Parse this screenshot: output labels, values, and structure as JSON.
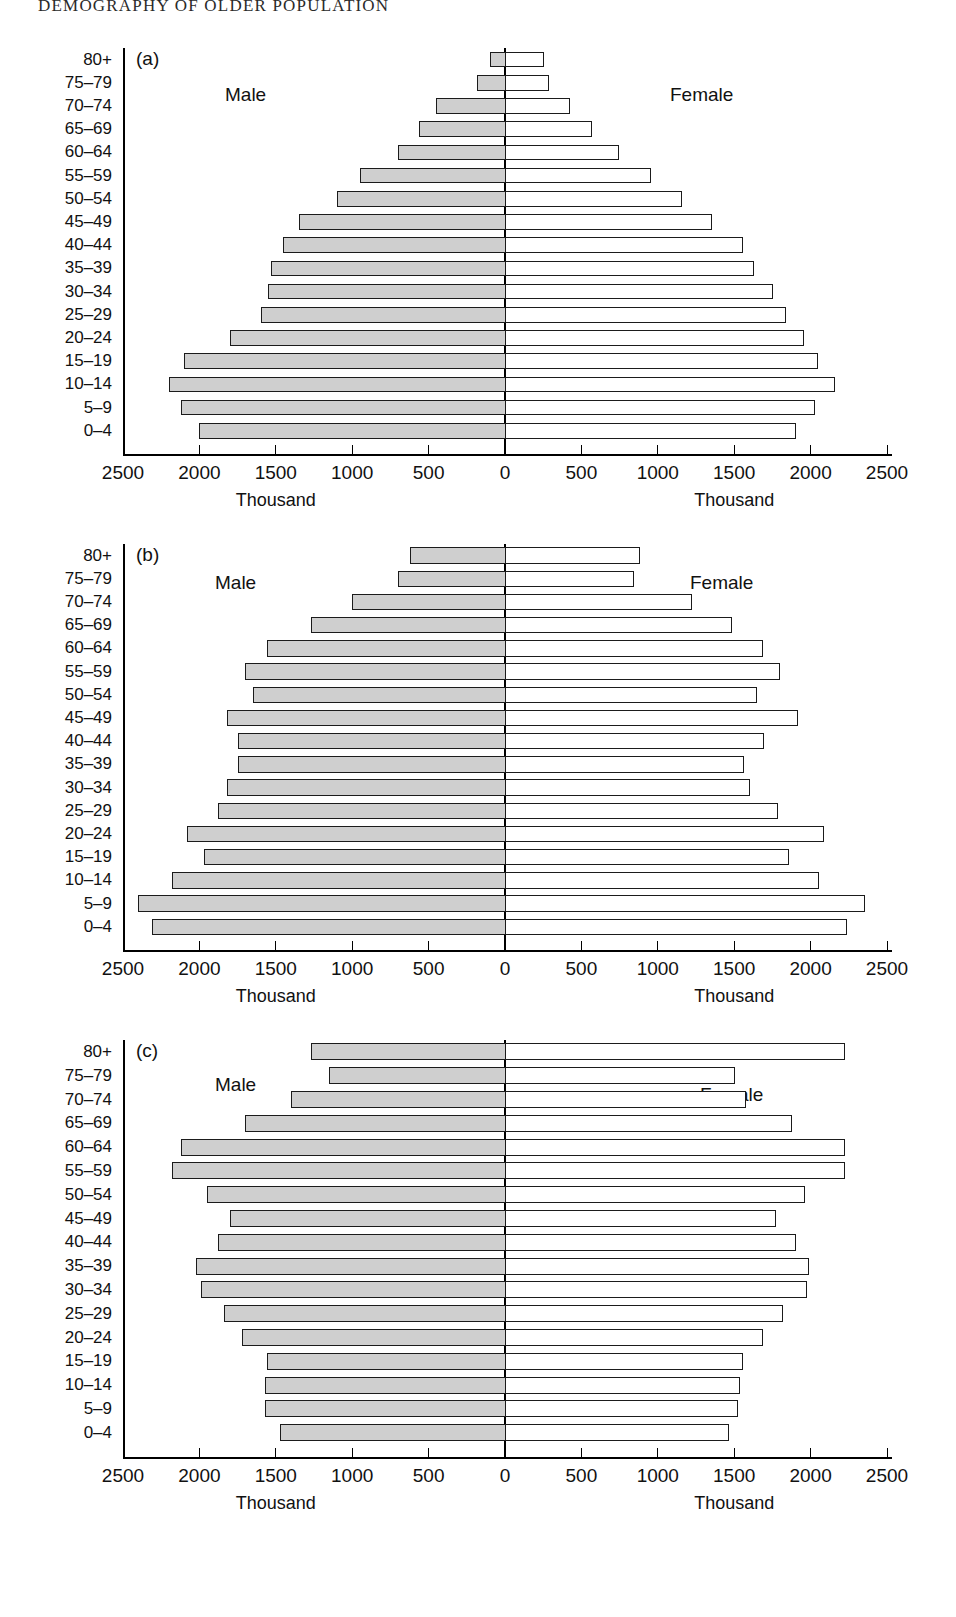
{
  "page": {
    "running_head": "DEMOGRAPHY OF OLDER POPULATION"
  },
  "axis": {
    "tick_labels_left": [
      "2500",
      "2000",
      "1500",
      "1000",
      "500"
    ],
    "tick_label_zero": "0",
    "tick_labels_right": [
      "500",
      "1000",
      "1500",
      "2000",
      "2500"
    ],
    "caption_male": "Thousand",
    "caption_female": "Thousand",
    "unit": "Thousand",
    "max": 2500,
    "tick_step": 500
  },
  "series_labels": {
    "male": "Male",
    "female": "Female"
  },
  "age_groups": [
    "80+",
    "75–79",
    "70–74",
    "65–69",
    "60–64",
    "55–59",
    "50–54",
    "45–49",
    "40–44",
    "35–39",
    "30–34",
    "25–29",
    "20–24",
    "15–19",
    "10–14",
    "5–9",
    "0–4"
  ],
  "panels": [
    {
      "id": "a",
      "tag": "(a)"
    },
    {
      "id": "b",
      "tag": "(b)"
    },
    {
      "id": "c",
      "tag": "(c)"
    }
  ],
  "colors": {
    "male_fill": "#cfcfcf",
    "female_fill": "#ffffff",
    "outline": "#1b1b1b"
  },
  "chart_data": [
    {
      "type": "bar",
      "subtype": "population-pyramid",
      "panel": "(a)",
      "title": "",
      "xlabel": "Thousand",
      "ylabel": "",
      "xlim": [
        -2500,
        2500
      ],
      "grid": false,
      "legend": "inline-labels",
      "categories": [
        "80+",
        "75–79",
        "70–74",
        "65–69",
        "60–64",
        "55–59",
        "50–54",
        "45–49",
        "40–44",
        "35–39",
        "30–34",
        "25–29",
        "20–24",
        "15–19",
        "10–14",
        "5–9",
        "0–4"
      ],
      "series": [
        {
          "name": "Male",
          "values": [
            100,
            180,
            450,
            560,
            700,
            950,
            1100,
            1350,
            1450,
            1530,
            1550,
            1600,
            1800,
            2100,
            2200,
            2120,
            2000
          ]
        },
        {
          "name": "Female",
          "values": [
            250,
            280,
            420,
            560,
            740,
            950,
            1150,
            1350,
            1550,
            1620,
            1750,
            1830,
            1950,
            2040,
            2150,
            2020,
            1900
          ]
        }
      ]
    },
    {
      "type": "bar",
      "subtype": "population-pyramid",
      "panel": "(b)",
      "title": "",
      "xlabel": "Thousand",
      "ylabel": "",
      "xlim": [
        -2500,
        2500
      ],
      "grid": false,
      "legend": "inline-labels",
      "categories": [
        "80+",
        "75–79",
        "70–74",
        "65–69",
        "60–64",
        "55–59",
        "50–54",
        "45–49",
        "40–44",
        "35–39",
        "30–34",
        "25–29",
        "20–24",
        "15–19",
        "10–14",
        "5–9",
        "0–4"
      ],
      "series": [
        {
          "name": "Male",
          "values": [
            620,
            700,
            1000,
            1270,
            1560,
            1700,
            1650,
            1820,
            1750,
            1750,
            1820,
            1880,
            2080,
            1970,
            2180,
            2400,
            2310
          ]
        },
        {
          "name": "Female",
          "values": [
            880,
            840,
            1220,
            1480,
            1680,
            1790,
            1640,
            1910,
            1690,
            1560,
            1600,
            1780,
            2080,
            1850,
            2050,
            2350,
            2230
          ]
        }
      ]
    },
    {
      "type": "bar",
      "subtype": "population-pyramid",
      "panel": "(c)",
      "title": "",
      "xlabel": "Thousand",
      "ylabel": "",
      "xlim": [
        -2500,
        2500
      ],
      "grid": false,
      "legend": "inline-labels",
      "categories": [
        "80+",
        "75–79",
        "70–74",
        "65–69",
        "60–64",
        "55–59",
        "50–54",
        "45–49",
        "40–44",
        "35–39",
        "30–34",
        "25–29",
        "20–24",
        "15–19",
        "10–14",
        "5–9",
        "0–4"
      ],
      "series": [
        {
          "name": "Male",
          "values": [
            1270,
            1150,
            1400,
            1700,
            2120,
            2180,
            1950,
            1800,
            1880,
            2020,
            1990,
            1840,
            1720,
            1560,
            1570,
            1570,
            1470
          ]
        },
        {
          "name": "Female",
          "values": [
            2220,
            1500,
            1570,
            1870,
            2220,
            2220,
            1960,
            1770,
            1900,
            1980,
            1970,
            1810,
            1680,
            1550,
            1530,
            1520,
            1460
          ]
        }
      ]
    }
  ]
}
